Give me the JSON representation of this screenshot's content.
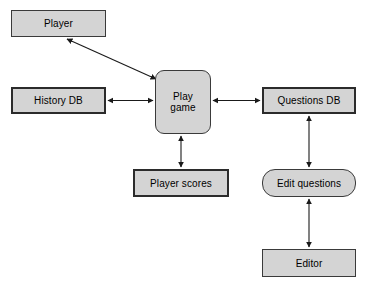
{
  "diagram": {
    "canvas": {
      "width": 365,
      "height": 284,
      "background": "#ffffff"
    },
    "style": {
      "node_fill": "#d4d4d4",
      "node_border_thin": "#3a3a3a",
      "node_border_thick": "#2b2b2b",
      "edge_color": "#1a1a1a",
      "text_color": "#000000"
    },
    "nodes": [
      {
        "id": "player",
        "label": "Player",
        "shape": "rectangle",
        "border": "thin"
      },
      {
        "id": "history_db",
        "label": "History DB",
        "shape": "rectangle",
        "border": "thick"
      },
      {
        "id": "play_game",
        "label": "Play\ngame",
        "shape": "rounded-rect",
        "border": "thin"
      },
      {
        "id": "questions_db",
        "label": "Questions DB",
        "shape": "rectangle",
        "border": "thick"
      },
      {
        "id": "player_scores",
        "label": "Player scores",
        "shape": "rectangle",
        "border": "thick"
      },
      {
        "id": "edit_questions",
        "label": "Edit questions",
        "shape": "stadium",
        "border": "thin"
      },
      {
        "id": "editor",
        "label": "Editor",
        "shape": "rectangle",
        "border": "thin"
      }
    ],
    "edges": [
      {
        "id": "player--play_game",
        "from": "player",
        "to": "play_game",
        "arrow": "double",
        "orientation": "diagonal"
      },
      {
        "id": "history_db--play_game",
        "from": "history_db",
        "to": "play_game",
        "arrow": "double",
        "orientation": "horizontal"
      },
      {
        "id": "play_game--questions_db",
        "from": "play_game",
        "to": "questions_db",
        "arrow": "double",
        "orientation": "horizontal"
      },
      {
        "id": "play_game--player_scores",
        "from": "play_game",
        "to": "player_scores",
        "arrow": "double",
        "orientation": "vertical"
      },
      {
        "id": "questions_db--edit_questions",
        "from": "questions_db",
        "to": "edit_questions",
        "arrow": "double",
        "orientation": "vertical"
      },
      {
        "id": "edit_questions--editor",
        "from": "edit_questions",
        "to": "editor",
        "arrow": "double",
        "orientation": "vertical"
      }
    ]
  }
}
